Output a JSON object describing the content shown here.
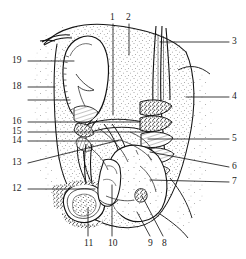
{
  "figure": {
    "kind": "anatomical-line-drawing",
    "style": "pen-and-ink stipple and hatch, black on white",
    "ink_color": "#1a1a1a",
    "background_color": "#ffffff",
    "width": 246,
    "height": 259
  },
  "callouts": [
    {
      "id": "callout-1",
      "label": "1",
      "text_x": 110,
      "text_y": 13,
      "anchor": "bottom",
      "line": [
        [
          113,
          24
        ],
        [
          113,
          115
        ]
      ]
    },
    {
      "id": "callout-2",
      "label": "2",
      "text_x": 126,
      "text_y": 13,
      "anchor": "bottom",
      "line": [
        [
          129,
          24
        ],
        [
          129,
          55
        ]
      ]
    },
    {
      "id": "callout-3",
      "label": "3",
      "text_x": 232,
      "text_y": 37,
      "anchor": "left",
      "line": [
        [
          229,
          42
        ],
        [
          160,
          42
        ]
      ]
    },
    {
      "id": "callout-4",
      "label": "4",
      "text_x": 232,
      "text_y": 92,
      "anchor": "left",
      "line": [
        [
          229,
          97
        ],
        [
          186,
          97
        ]
      ]
    },
    {
      "id": "callout-5",
      "label": "5",
      "text_x": 232,
      "text_y": 134,
      "anchor": "left",
      "line": [
        [
          229,
          139
        ],
        [
          148,
          139
        ]
      ]
    },
    {
      "id": "callout-6",
      "label": "6",
      "text_x": 232,
      "text_y": 162,
      "anchor": "left",
      "line": [
        [
          229,
          167
        ],
        [
          150,
          152
        ]
      ]
    },
    {
      "id": "callout-7",
      "label": "7",
      "text_x": 232,
      "text_y": 177,
      "anchor": "left",
      "line": [
        [
          229,
          182
        ],
        [
          150,
          180
        ]
      ]
    },
    {
      "id": "callout-8",
      "label": "8",
      "text_x": 162,
      "text_y": 239,
      "anchor": "top",
      "line": [
        [
          163,
          236
        ],
        [
          142,
          196
        ]
      ]
    },
    {
      "id": "callout-9",
      "label": "9",
      "text_x": 148,
      "text_y": 239,
      "anchor": "top",
      "line": [
        [
          150,
          236
        ],
        [
          137,
          212
        ]
      ]
    },
    {
      "id": "callout-10",
      "label": "10",
      "text_x": 108,
      "text_y": 239,
      "anchor": "top",
      "line": [
        [
          112,
          236
        ],
        [
          112,
          185
        ]
      ]
    },
    {
      "id": "callout-11",
      "label": "11",
      "text_x": 84,
      "text_y": 239,
      "anchor": "top",
      "line": [
        [
          88,
          236
        ],
        [
          88,
          208
        ]
      ]
    },
    {
      "id": "callout-12",
      "label": "12",
      "text_x": 12,
      "text_y": 184,
      "anchor": "right",
      "line": [
        [
          28,
          189
        ],
        [
          95,
          189
        ]
      ]
    },
    {
      "id": "callout-13",
      "label": "13",
      "text_x": 12,
      "text_y": 158,
      "anchor": "right",
      "line": [
        [
          28,
          163
        ],
        [
          120,
          140
        ]
      ]
    },
    {
      "id": "callout-14",
      "label": "14",
      "text_x": 12,
      "text_y": 136,
      "anchor": "right",
      "line": [
        [
          28,
          141
        ],
        [
          118,
          141
        ]
      ]
    },
    {
      "id": "callout-15",
      "label": "15",
      "text_x": 12,
      "text_y": 127,
      "anchor": "right",
      "line": [
        [
          28,
          132
        ],
        [
          150,
          132
        ]
      ]
    },
    {
      "id": "callout-16",
      "label": "16",
      "text_x": 12,
      "text_y": 117,
      "anchor": "right",
      "line": [
        [
          28,
          122
        ],
        [
          140,
          122
        ]
      ]
    },
    {
      "id": "callout-18",
      "label": "18",
      "text_x": 12,
      "text_y": 82,
      "anchor": "right",
      "line": [
        [
          28,
          87
        ],
        [
          55,
          87
        ]
      ]
    },
    {
      "id": "callout-19",
      "label": "19",
      "text_x": 12,
      "text_y": 56,
      "anchor": "right",
      "line": [
        [
          28,
          61
        ],
        [
          74,
          61
        ]
      ]
    },
    {
      "id": "callout-unnumbered",
      "label": "",
      "text_x": 0,
      "text_y": 0,
      "anchor": "right",
      "line": [
        [
          28,
          100
        ],
        [
          70,
          100
        ]
      ]
    }
  ]
}
